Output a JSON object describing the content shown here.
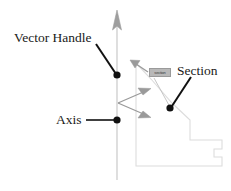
{
  "diagram": {
    "labels": {
      "vector_handle": "Vector Handle",
      "axis": "Axis",
      "section": "Section"
    },
    "section_tag": {
      "text": "section",
      "fill": "#b8b8b8",
      "stroke": "#9a9a9a"
    },
    "colors": {
      "axis_line": "#c8c8c8",
      "axis_arrow": "#9e9e9e",
      "leader_line": "#111111",
      "leader_dot": "#111111",
      "vector_arrow": "#9a9a9a",
      "section_outline": "#dcdcdc",
      "tag_leader": "#c0c0c0",
      "text": "#1a1a1a",
      "background": "#ffffff"
    },
    "geometry": {
      "axis_x": 117,
      "axis_top_y": 12,
      "axis_bottom_y": 180,
      "vector_handle_dot": [
        117,
        75
      ],
      "axis_dot": [
        117,
        120
      ],
      "section_dot": [
        170,
        108
      ],
      "vector_origin": [
        118,
        103
      ],
      "vector_arrow_tips": [
        [
          150,
          89
        ],
        [
          150,
          116
        ]
      ],
      "section_top_arrow_tip": [
        130,
        60
      ],
      "section_outline_points": "136,63 136,166 222,166 222,157 214,157 214,149 222,149 222,140 190,140 190,120 172,103 151,79 136,63"
    },
    "annotations": [
      {
        "name": "vector-handle-annotation",
        "label": "Vector Handle",
        "leader_from": [
          96,
          44
        ],
        "leader_to": [
          116,
          74
        ]
      },
      {
        "name": "axis-annotation",
        "label": "Axis",
        "leader_from": [
          86,
          120
        ],
        "leader_to": [
          115,
          120
        ]
      },
      {
        "name": "section-annotation",
        "label": "Section",
        "leader_from": [
          190,
          78
        ],
        "leader_to": [
          171,
          107
        ]
      }
    ]
  }
}
